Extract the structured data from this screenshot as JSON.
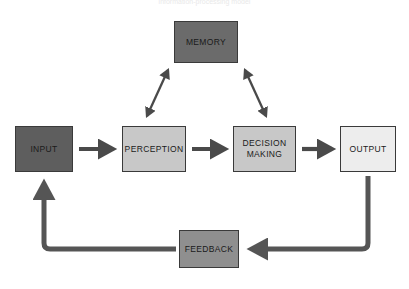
{
  "caption": {
    "text": "information-processing model"
  },
  "diagram": {
    "background_color": "#ffffff",
    "nodes": [
      {
        "id": "memory",
        "label": "MEMORY",
        "fill": "#6b6b6b",
        "border": "#3a3a3a",
        "text_color": "#1a1a1a"
      },
      {
        "id": "input",
        "label": "INPUT",
        "fill": "#5e5e5e",
        "border": "#3a3a3a",
        "text_color": "#1a1a1a"
      },
      {
        "id": "perception",
        "label": "PERCEPTION",
        "fill": "#c8c8c8",
        "border": "#3a3a3a",
        "text_color": "#1a1a1a"
      },
      {
        "id": "decision",
        "label_line1": "DECISION",
        "label_line2": "MAKING",
        "fill": "#c8c8c8",
        "border": "#3a3a3a",
        "text_color": "#1a1a1a"
      },
      {
        "id": "output",
        "label": "OUTPUT",
        "fill": "#ededed",
        "border": "#3a3a3a",
        "text_color": "#1a1a1a"
      },
      {
        "id": "feedback",
        "label": "FEEDBACK",
        "fill": "#8f8f8f",
        "border": "#3a3a3a",
        "text_color": "#1a1a1a"
      }
    ],
    "connectors": [
      {
        "id": "input-to-perception",
        "from": "input",
        "to": "perception",
        "style": "arrow",
        "direction": "right",
        "color": "#4a4a4a"
      },
      {
        "id": "perception-to-decision",
        "from": "perception",
        "to": "decision",
        "style": "arrow",
        "direction": "right",
        "color": "#4a4a4a"
      },
      {
        "id": "decision-to-output",
        "from": "decision",
        "to": "output",
        "style": "arrow",
        "direction": "right",
        "color": "#4a4a4a"
      },
      {
        "id": "memory-perception",
        "from": "memory",
        "to": "perception",
        "style": "double-arrow",
        "direction": "diagonal-left",
        "color": "#4a4a4a"
      },
      {
        "id": "memory-decision",
        "from": "memory",
        "to": "decision",
        "style": "double-arrow",
        "direction": "diagonal-right",
        "color": "#4a4a4a"
      },
      {
        "id": "output-to-feedback",
        "from": "output",
        "to": "feedback",
        "style": "elbow-arrow",
        "direction": "down-left",
        "color": "#555555"
      },
      {
        "id": "feedback-to-input",
        "from": "feedback",
        "to": "input",
        "style": "elbow-arrow",
        "direction": "left-up",
        "color": "#555555"
      }
    ]
  }
}
